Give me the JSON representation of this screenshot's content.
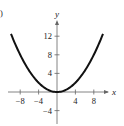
{
  "panel_label": ")",
  "chart_data": {
    "type": "line",
    "title": "",
    "xlabel": "x",
    "ylabel": "y",
    "function": "y = x^2 / 8",
    "xlim": [
      -10,
      10
    ],
    "ylim": [
      -6,
      16
    ],
    "grid": false,
    "x_ticks": [
      -8,
      -4,
      4,
      8
    ],
    "x_tick_labels": [
      "-8",
      "-4",
      "4",
      "8"
    ],
    "y_ticks": [
      12,
      8,
      4,
      -4
    ],
    "y_tick_labels": [
      "12",
      "8",
      "4",
      "-4"
    ],
    "series": [
      {
        "name": "parabola",
        "x": [
          -10,
          -8,
          -6,
          -4,
          -2,
          0,
          2,
          4,
          6,
          8,
          10
        ],
        "values": [
          12.5,
          8,
          4.5,
          2,
          0.5,
          0,
          0.5,
          2,
          4.5,
          8,
          12.5
        ]
      }
    ],
    "colors": {
      "curve": "#111111",
      "axes": "#666666",
      "text": "#222222"
    }
  }
}
